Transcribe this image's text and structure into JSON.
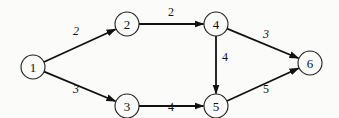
{
  "diagram": {
    "type": "directed-weighted-graph",
    "nodes": [
      {
        "id": "1",
        "label": "1",
        "x": 33,
        "y": 67
      },
      {
        "id": "2",
        "label": "2",
        "x": 127,
        "y": 24
      },
      {
        "id": "3",
        "label": "3",
        "x": 127,
        "y": 106
      },
      {
        "id": "4",
        "label": "4",
        "x": 216,
        "y": 24
      },
      {
        "id": "5",
        "label": "5",
        "x": 216,
        "y": 106
      },
      {
        "id": "6",
        "label": "6",
        "x": 310,
        "y": 63
      }
    ],
    "node_radius": 12,
    "edges": [
      {
        "from": "1",
        "to": "2",
        "weight": "2",
        "label_x": 76,
        "label_y": 31,
        "italic": true
      },
      {
        "from": "1",
        "to": "3",
        "weight": "3",
        "label_x": 76,
        "label_y": 89,
        "italic": true
      },
      {
        "from": "2",
        "to": "4",
        "weight": "2",
        "label_x": 171,
        "label_y": 12,
        "italic": false
      },
      {
        "from": "3",
        "to": "5",
        "weight": "4",
        "label_x": 171,
        "label_y": 107,
        "italic": false
      },
      {
        "from": "4",
        "to": "5",
        "weight": "4",
        "label_x": 225,
        "label_y": 57,
        "italic": false
      },
      {
        "from": "4",
        "to": "6",
        "weight": "3",
        "label_x": 266,
        "label_y": 34,
        "italic": true
      },
      {
        "from": "5",
        "to": "6",
        "weight": "5",
        "label_x": 266,
        "label_y": 89,
        "italic": false
      }
    ]
  }
}
